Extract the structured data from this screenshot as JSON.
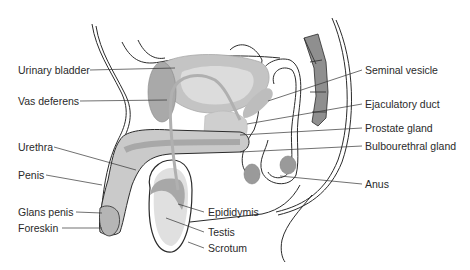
{
  "diagram": {
    "colors": {
      "outline": "#2b2b2b",
      "tissue_light": "#d9d9d9",
      "tissue_mid": "#bdbdbd",
      "tissue_dark": "#9c9c9c",
      "leader": "#333333",
      "text": "#2a2a2a"
    },
    "labels": {
      "urinary_bladder": "Urinary bladder",
      "vas_deferens": "Vas deferens",
      "urethra": "Urethra",
      "penis": "Penis",
      "glans_penis": "Glans penis",
      "foreskin": "Foreskin",
      "epididymis": "Epididymis",
      "testis": "Testis",
      "scrotum": "Scrotum",
      "seminal_vesicle": "Seminal vesicle",
      "ejaculatory_duct": "Ejaculatory duct",
      "prostate_gland": "Prostate gland",
      "bulbourethral_gland": "Bulbourethral gland",
      "anus": "Anus"
    }
  }
}
